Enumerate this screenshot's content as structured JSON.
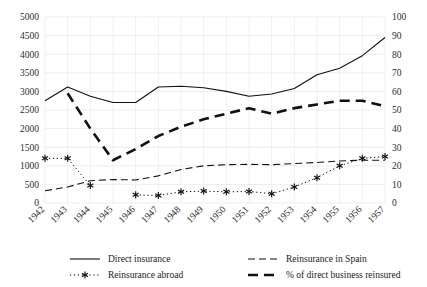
{
  "chart_data": {
    "type": "line",
    "title": "",
    "subtitle": "",
    "xlabel": "",
    "ylabel": "",
    "y2label": "",
    "grid": true,
    "legend_position": "bottom",
    "categories": [
      "1942",
      "1943",
      "1944",
      "1945",
      "1946",
      "1947",
      "1948",
      "1949",
      "1950",
      "1951",
      "1952",
      "1953",
      "1954",
      "1955",
      "1956",
      "1957"
    ],
    "ylim": [
      0,
      5000
    ],
    "yticks": [
      "0",
      "500",
      "1000",
      "1500",
      "2000",
      "2500",
      "3000",
      "3500",
      "4000",
      "4500",
      "5000"
    ],
    "y2lim": [
      0,
      100
    ],
    "y2ticks": [
      "0",
      "10",
      "20",
      "30",
      "40",
      "50",
      "60",
      "70",
      "80",
      "90",
      "100"
    ],
    "series": [
      {
        "name": "Direct insurance",
        "axis": "left",
        "style": "solid",
        "marker": "none",
        "values": [
          2750,
          3120,
          2870,
          2700,
          2700,
          3120,
          3140,
          3100,
          3000,
          2870,
          2930,
          3080,
          3450,
          3620,
          3960,
          4450
        ]
      },
      {
        "name": "Reinsurance in Spain",
        "axis": "left",
        "style": "dashed-thin",
        "marker": "none",
        "values": [
          330,
          430,
          600,
          630,
          620,
          730,
          900,
          1000,
          1030,
          1040,
          1030,
          1060,
          1090,
          1130,
          1150,
          1150
        ]
      },
      {
        "name": "Reinsurance abroad",
        "axis": "left",
        "style": "dotted",
        "marker": "asterisk",
        "values": [
          1200,
          1200,
          470,
          null,
          220,
          200,
          300,
          320,
          300,
          310,
          250,
          430,
          680,
          1000,
          1200,
          1250
        ]
      },
      {
        "name": "% of direct business reinsured",
        "axis": "right",
        "style": "dashed-thick",
        "marker": "none",
        "values": [
          null,
          59,
          40,
          23,
          29,
          36,
          41,
          45,
          48,
          51,
          48,
          51,
          53,
          55,
          55,
          52
        ]
      }
    ]
  },
  "legend": {
    "items": [
      {
        "label": "Direct insurance",
        "style": "solid"
      },
      {
        "label": "Reinsurance in Spain",
        "style": "dashed-thin"
      },
      {
        "label": "Reinsurance abroad",
        "style": "dotted"
      },
      {
        "label": "% of direct business reinsured",
        "style": "dashed-thick"
      }
    ]
  }
}
